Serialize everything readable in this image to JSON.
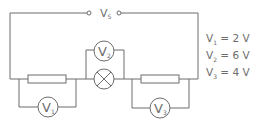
{
  "diagram": {
    "type": "circuit",
    "supply": {
      "label": "V",
      "subscript": "S"
    },
    "components": [
      {
        "id": "resistor-1",
        "kind": "resistor"
      },
      {
        "id": "lamp",
        "kind": "lamp"
      },
      {
        "id": "resistor-2",
        "kind": "resistor"
      },
      {
        "id": "voltmeter-1",
        "kind": "voltmeter",
        "label": "V",
        "subscript": "1",
        "across": "resistor-1"
      },
      {
        "id": "voltmeter-2",
        "kind": "voltmeter",
        "label": "V",
        "subscript": "2",
        "across": "lamp"
      },
      {
        "id": "voltmeter-3",
        "kind": "voltmeter",
        "label": "V",
        "subscript": "3",
        "across": "resistor-2"
      }
    ],
    "readings": [
      {
        "name": "V",
        "sub": "1",
        "text": " = 2 V",
        "value": 2,
        "unit": "V"
      },
      {
        "name": "V",
        "sub": "2",
        "text": " = 6 V",
        "value": 6,
        "unit": "V"
      },
      {
        "name": "V",
        "sub": "3",
        "text": " = 4 V",
        "value": 4,
        "unit": "V"
      }
    ],
    "color": "#6d6d6d"
  }
}
